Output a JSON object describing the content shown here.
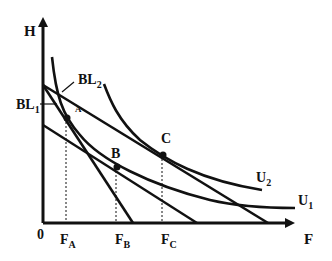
{
  "diagram": {
    "axes": {
      "y_label": "H",
      "x_label": "F",
      "origin_label": "0"
    },
    "x_ticks": [
      {
        "label": "F",
        "sub": "A"
      },
      {
        "label": "F",
        "sub": "B"
      },
      {
        "label": "F",
        "sub": "C"
      }
    ],
    "points": [
      {
        "label": "A"
      },
      {
        "label": "B"
      },
      {
        "label": "C"
      }
    ],
    "budget_lines": [
      {
        "label": "BL",
        "sub": "1"
      },
      {
        "label": "BL",
        "sub": "2"
      }
    ],
    "indifference_curves": [
      {
        "label": "U",
        "sub": "1"
      },
      {
        "label": "U",
        "sub": "2"
      }
    ],
    "colors": {
      "ink": "#111111",
      "background": "#ffffff"
    }
  }
}
